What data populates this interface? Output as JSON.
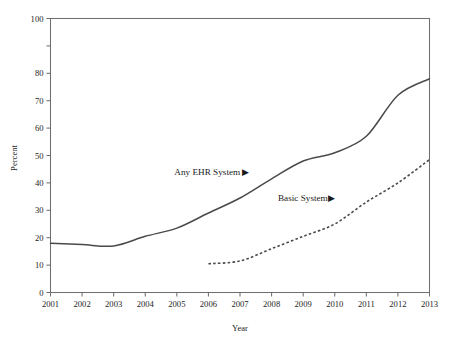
{
  "chart_data": {
    "type": "line",
    "title": "",
    "xlabel": "Year",
    "ylabel": "Percent",
    "x": [
      2001,
      2002,
      2003,
      2004,
      2005,
      2006,
      2007,
      2008,
      2009,
      2010,
      2011,
      2012,
      2013
    ],
    "xtick_labels": [
      "2001",
      "2002",
      "2003",
      "2004",
      "2005",
      "2006",
      "2007",
      "2008",
      "2009",
      "2010",
      "2011",
      "2012",
      "2013"
    ],
    "ytick_labels": [
      "0",
      "10",
      "20",
      "30",
      "40",
      "50",
      "60",
      "70",
      "80",
      "",
      "100"
    ],
    "ytick_values": [
      0,
      10,
      20,
      30,
      40,
      50,
      60,
      70,
      80,
      90,
      100
    ],
    "xlim": [
      2001,
      2013
    ],
    "ylim": [
      0,
      100
    ],
    "grid": false,
    "legend_position": "inline-annotation",
    "series": [
      {
        "name": "Any EHR System",
        "style": "solid",
        "color": "#4a4a4a",
        "x": [
          2001,
          2002,
          2003,
          2004,
          2005,
          2006,
          2007,
          2008,
          2009,
          2010,
          2011,
          2012,
          2013
        ],
        "values": [
          18.0,
          17.5,
          17.0,
          20.5,
          23.5,
          29.0,
          34.5,
          41.5,
          48.0,
          51.0,
          57.0,
          72.0,
          78.0
        ]
      },
      {
        "name": "Basic System",
        "style": "dashed",
        "color": "#4a4a4a",
        "x": [
          2006,
          2007,
          2008,
          2009,
          2010,
          2011,
          2012,
          2013
        ],
        "values": [
          10.5,
          11.5,
          16.0,
          20.5,
          25.0,
          33.0,
          40.0,
          48.5
        ]
      }
    ],
    "annotations": [
      {
        "text": "Any EHR System ▶",
        "x": 2007.3,
        "y": 43.0,
        "anchor": "end"
      },
      {
        "text": "Basic System▶",
        "x": 2010.0,
        "y": 33.5,
        "anchor": "end"
      }
    ]
  }
}
